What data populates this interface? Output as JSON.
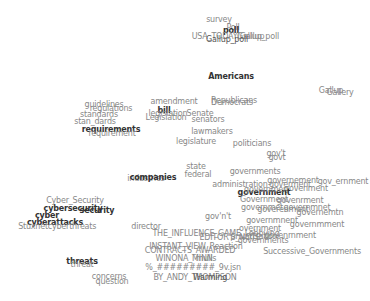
{
  "chart_data": {
    "type": "scatter",
    "title": "",
    "xlabel": "",
    "ylabel": "",
    "grid": false,
    "legend": null,
    "points": [
      {
        "text": "survey",
        "x": 219,
        "y": 20,
        "w": "n"
      },
      {
        "text": "Poll",
        "x": 233,
        "y": 28,
        "w": "n"
      },
      {
        "text": "poll",
        "x": 231,
        "y": 31,
        "w": "b"
      },
      {
        "text": "USA_TODAY/Gallup",
        "x": 228,
        "y": 37,
        "w": "n"
      },
      {
        "text": "Gallup_poll",
        "x": 258,
        "y": 37,
        "w": "n"
      },
      {
        "text": "Gallup_poll",
        "x": 227,
        "y": 40,
        "w": "d"
      },
      {
        "text": "Americans",
        "x": 231,
        "y": 77,
        "w": "b"
      },
      {
        "text": "Gallup",
        "x": 331,
        "y": 91,
        "w": "n"
      },
      {
        "text": "Gallery",
        "x": 340,
        "y": 93,
        "w": "n"
      },
      {
        "text": "Republicans",
        "x": 234,
        "y": 101,
        "w": "n"
      },
      {
        "text": "Democrats",
        "x": 232,
        "y": 103,
        "w": "n"
      },
      {
        "text": "amendment",
        "x": 174,
        "y": 102,
        "w": "n"
      },
      {
        "text": "bill",
        "x": 164,
        "y": 111,
        "w": "b"
      },
      {
        "text": "legislation",
        "x": 168,
        "y": 114,
        "w": "n"
      },
      {
        "text": "Senate",
        "x": 200,
        "y": 114,
        "w": "n"
      },
      {
        "text": "Legislation",
        "x": 166,
        "y": 118,
        "w": "n"
      },
      {
        "text": "senators",
        "x": 208,
        "y": 120,
        "w": "n"
      },
      {
        "text": "guidelines",
        "x": 104,
        "y": 105,
        "w": "n"
      },
      {
        "text": "regulations",
        "x": 111,
        "y": 109,
        "w": "n"
      },
      {
        "text": "standards",
        "x": 99,
        "y": 115,
        "w": "n"
      },
      {
        "text": "stan_dards",
        "x": 95,
        "y": 122,
        "w": "n"
      },
      {
        "text": "requirements",
        "x": 111,
        "y": 130,
        "w": "b"
      },
      {
        "text": "requirement",
        "x": 112,
        "y": 134,
        "w": "n"
      },
      {
        "text": "lawmakers",
        "x": 212,
        "y": 132,
        "w": "n"
      },
      {
        "text": "legislature",
        "x": 196,
        "y": 142,
        "w": "n"
      },
      {
        "text": "politicians",
        "x": 252,
        "y": 144,
        "w": "n"
      },
      {
        "text": "gov't",
        "x": 276,
        "y": 154,
        "w": "n"
      },
      {
        "text": "govt",
        "x": 277,
        "y": 158,
        "w": "n"
      },
      {
        "text": "state",
        "x": 196,
        "y": 167,
        "w": "n"
      },
      {
        "text": "federal",
        "x": 198,
        "y": 175,
        "w": "n"
      },
      {
        "text": "governments",
        "x": 255,
        "y": 172,
        "w": "n"
      },
      {
        "text": "industries",
        "x": 146,
        "y": 179,
        "w": "n"
      },
      {
        "text": "companies",
        "x": 153,
        "y": 178,
        "w": "b"
      },
      {
        "text": "administration",
        "x": 240,
        "y": 185,
        "w": "n"
      },
      {
        "text": "governement",
        "x": 293,
        "y": 181,
        "w": "n"
      },
      {
        "text": "goverment",
        "x": 290,
        "y": 185,
        "w": "n"
      },
      {
        "text": "gov_ernment",
        "x": 343,
        "y": 182,
        "w": "n"
      },
      {
        "text": "govenment",
        "x": 306,
        "y": 189,
        "w": "n"
      },
      {
        "text": "government",
        "x": 264,
        "y": 193,
        "w": "b"
      },
      {
        "text": "governmen",
        "x": 266,
        "y": 190,
        "w": "n"
      },
      {
        "text": "Government",
        "x": 264,
        "y": 200,
        "w": "n"
      },
      {
        "text": "govenrment",
        "x": 300,
        "y": 201,
        "w": "n"
      },
      {
        "text": "governmet",
        "x": 262,
        "y": 208,
        "w": "n"
      },
      {
        "text": "goverenment",
        "x": 283,
        "y": 210,
        "w": "n"
      },
      {
        "text": "governmnet",
        "x": 307,
        "y": 208,
        "w": "n"
      },
      {
        "text": "governemtn",
        "x": 320,
        "y": 213,
        "w": "n"
      },
      {
        "text": "gov'n't",
        "x": 218,
        "y": 217,
        "w": "n"
      },
      {
        "text": "governmnent",
        "x": 272,
        "y": 221,
        "w": "n"
      },
      {
        "text": "governmment",
        "x": 317,
        "y": 225,
        "w": "n"
      },
      {
        "text": "overnment",
        "x": 260,
        "y": 229,
        "w": "n"
      },
      {
        "text": "Cyber_Security",
        "x": 75,
        "y": 201,
        "w": "n"
      },
      {
        "text": "cybersecurity",
        "x": 73,
        "y": 209,
        "w": "b"
      },
      {
        "text": "security",
        "x": 97,
        "y": 211,
        "w": "b"
      },
      {
        "text": "cyber",
        "x": 47,
        "y": 216,
        "w": "b"
      },
      {
        "text": "cyberattacks",
        "x": 55,
        "y": 223,
        "w": "b"
      },
      {
        "text": "Stuxnet",
        "x": 33,
        "y": 227,
        "w": "n"
      },
      {
        "text": "cyberthreats",
        "x": 72,
        "y": 227,
        "w": "n"
      },
      {
        "text": "director",
        "x": 146,
        "y": 227,
        "w": "n"
      },
      {
        "text": "THE_INFLUENCE_GAME_Lobbying",
        "x": 216,
        "y": 234,
        "w": "n"
      },
      {
        "text": "EDITOR'S_NOTE",
        "x": 230,
        "y": 238,
        "w": "n"
      },
      {
        "text": "privatisation",
        "x": 254,
        "y": 237,
        "w": "n"
      },
      {
        "text": "govenrnment",
        "x": 290,
        "y": 236,
        "w": "n"
      },
      {
        "text": "governments",
        "x": 263,
        "y": 241,
        "w": "n"
      },
      {
        "text": "INSTANT_VIEW_Reaction",
        "x": 196,
        "y": 247,
        "w": "n"
      },
      {
        "text": "CONTRACTS_AWARDED",
        "x": 190,
        "y": 251,
        "w": "n"
      },
      {
        "text": "Successive_Governments",
        "x": 312,
        "y": 252,
        "w": "n"
      },
      {
        "text": "WINONA_MINN",
        "x": 184,
        "y": 259,
        "w": "n"
      },
      {
        "text": "mulls",
        "x": 206,
        "y": 259,
        "w": "n"
      },
      {
        "text": "%_#########_9v.jsn",
        "x": 193,
        "y": 268,
        "w": "n"
      },
      {
        "text": "BY_ANDY_THOMPSON",
        "x": 195,
        "y": 278,
        "w": "n"
      },
      {
        "text": "Warming",
        "x": 210,
        "y": 278,
        "w": "d"
      },
      {
        "text": "threats",
        "x": 82,
        "y": 262,
        "w": "b"
      },
      {
        "text": "threat",
        "x": 82,
        "y": 265,
        "w": "n"
      },
      {
        "text": "concerns",
        "x": 109,
        "y": 277,
        "w": "n"
      },
      {
        "text": "question",
        "x": 112,
        "y": 282,
        "w": "n"
      }
    ]
  }
}
